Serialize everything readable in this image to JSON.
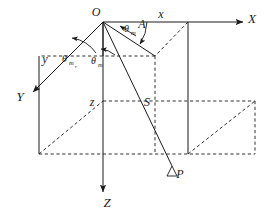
{
  "figure": {
    "background_color": "#ffffff",
    "line_color": "#1a1a1a"
  },
  "axes": [
    {
      "id": "x-axis",
      "label": "X",
      "direction": "right",
      "label_x": 252,
      "label_y": 23
    },
    {
      "id": "y-axis",
      "label": "Y",
      "direction": "lower-left",
      "label_x": 20,
      "label_y": 101
    },
    {
      "id": "z-axis",
      "label": "Z",
      "direction": "down",
      "label_x": 107,
      "label_y": 207
    }
  ],
  "components": [
    {
      "id": "x-component",
      "label": "x",
      "label_x": 161,
      "label_y": 18
    },
    {
      "id": "y-component",
      "label": "y",
      "label_x": 45,
      "label_y": 63
    },
    {
      "id": "z-component",
      "label": "z",
      "label_x": 92,
      "label_y": 106
    }
  ],
  "points": [
    {
      "id": "origin",
      "label": "O",
      "label_x": 96,
      "label_y": 16
    },
    {
      "id": "point-a",
      "label": "A",
      "label_x": 142,
      "label_y": 28
    },
    {
      "id": "point-s",
      "label": "S",
      "label_x": 147,
      "label_y": 106
    },
    {
      "id": "point-p",
      "label": "P",
      "label_x": 180,
      "label_y": 178
    }
  ],
  "angles": [
    {
      "id": "theta-m-upper",
      "base": "θ",
      "subscript": "m",
      "subscript2": "",
      "label_x": 124,
      "label_y": 32
    },
    {
      "id": "theta-mr",
      "base": "θ",
      "subscript": "m",
      "subscript2": "r",
      "label_x": 62,
      "label_y": 62
    },
    {
      "id": "theta-m-lower",
      "base": "θ",
      "subscript": "m",
      "subscript2": "",
      "label_x": 91,
      "label_y": 64
    }
  ],
  "markers": [
    {
      "id": "p-triangle-marker",
      "shape": "triangle",
      "x": 172,
      "y": 168
    }
  ]
}
